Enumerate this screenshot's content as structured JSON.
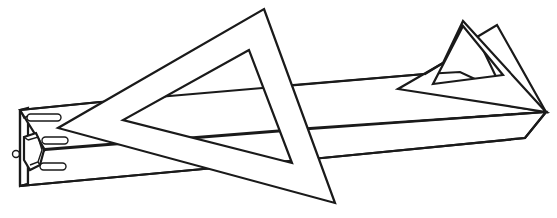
{
  "figure": {
    "alt": "Line drawing of a long rectangular beam with slotted end fitting, overlaid by a large triangular frame and a small triangular frame at the far end",
    "stroke_color": "#1a1a1a",
    "background_color": "#ffffff",
    "parts": [
      {
        "name": "beam",
        "description": "long rectangular bar in perspective"
      },
      {
        "name": "end-fitting",
        "description": "bracket with three slots and a small ring at left end"
      },
      {
        "name": "large-triangle",
        "description": "large triangular frame with inner triangular cutout"
      },
      {
        "name": "small-triangle",
        "description": "small triangular frame at right end with inner cutout"
      }
    ]
  }
}
